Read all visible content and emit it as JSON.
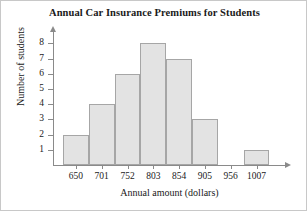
{
  "chart_data": {
    "type": "bar",
    "title": "Annual Car Insurance Premiums for Students",
    "xlabel": "Annual amount (dollars)",
    "ylabel": "Number of students",
    "categories": [
      "650",
      "701",
      "752",
      "803",
      "854",
      "905",
      "956",
      "1007"
    ],
    "values": [
      2,
      4,
      6,
      8,
      7,
      3,
      0,
      1
    ],
    "ytick_labels": [
      "8",
      "7",
      "6",
      "5",
      "4",
      "3",
      "2",
      "1"
    ],
    "ytick_values": [
      8,
      7,
      6,
      5,
      4,
      3,
      2,
      1
    ],
    "ylim": [
      0,
      8.8
    ],
    "xlim_categories": 8,
    "grid": false,
    "legend": null,
    "bar_fill_color": "#e3e3e3",
    "bar_border_color": "#a6a6a6",
    "axis_color": "#8a8a8a",
    "text_color": "#1a1a1a",
    "background_color": "#ffffff"
  }
}
